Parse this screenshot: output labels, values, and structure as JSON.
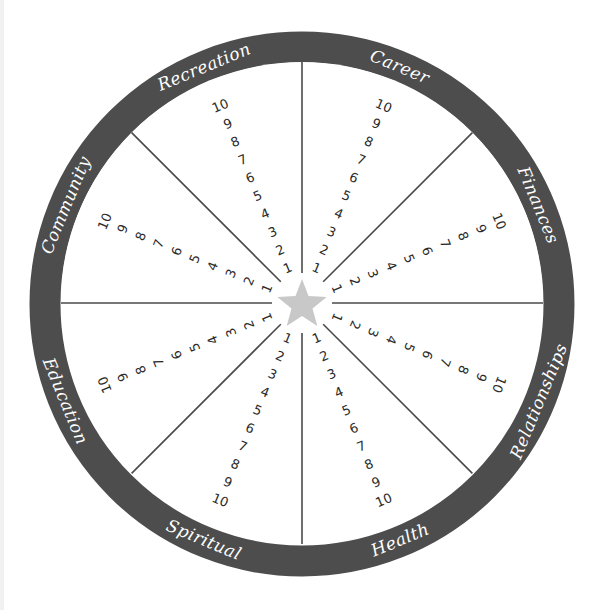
{
  "diagram": {
    "center_icon": "star-icon",
    "colors": {
      "ring": "#4d4d4d",
      "spokes": "#4a4a4a",
      "star": "#c8c8c8",
      "numbers": "#2b2b2b",
      "labels": "#ffffff",
      "background": "#ffffff"
    },
    "scale": [
      "1",
      "2",
      "3",
      "4",
      "5",
      "6",
      "7",
      "8",
      "9",
      "10"
    ],
    "sectors": [
      {
        "id": "recreation",
        "label": "Recreation",
        "angle": -22.5
      },
      {
        "id": "career",
        "label": "Career",
        "angle": 22.5
      },
      {
        "id": "finances",
        "label": "Finances",
        "angle": 67.5
      },
      {
        "id": "relationships",
        "label": "Relationships",
        "angle": 112.5
      },
      {
        "id": "health",
        "label": "Health",
        "angle": 157.5
      },
      {
        "id": "spiritual",
        "label": "Spiritual",
        "angle": 202.5
      },
      {
        "id": "education",
        "label": "Education",
        "angle": 247.5
      },
      {
        "id": "community",
        "label": "Community",
        "angle": 292.5
      }
    ]
  }
}
